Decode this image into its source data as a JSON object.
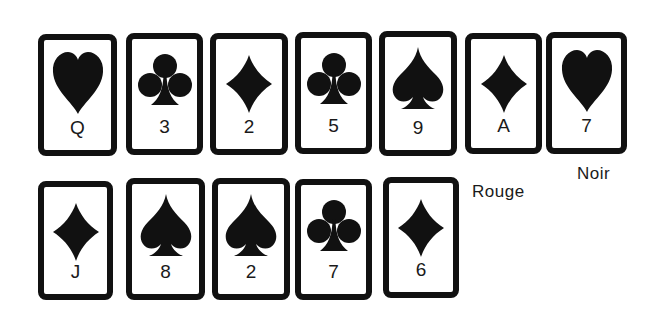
{
  "colors": {
    "ink": "#111111",
    "background": "#ffffff"
  },
  "rows": [
    {
      "cards": [
        {
          "suit": "heart",
          "icon": "heart-icon",
          "rank": "Q"
        },
        {
          "suit": "club",
          "icon": "club-icon",
          "rank": "3"
        },
        {
          "suit": "diamond",
          "icon": "diamond-icon",
          "rank": "2"
        },
        {
          "suit": "club",
          "icon": "club-icon",
          "rank": "5"
        },
        {
          "suit": "spade",
          "icon": "spade-icon",
          "rank": "9"
        },
        {
          "suit": "diamond",
          "icon": "diamond-icon",
          "rank": "A"
        },
        {
          "suit": "heart",
          "icon": "heart-icon",
          "rank": "7"
        }
      ]
    },
    {
      "cards": [
        {
          "suit": "diamond",
          "icon": "diamond-icon",
          "rank": "J"
        },
        {
          "suit": "spade",
          "icon": "spade-icon",
          "rank": "8"
        },
        {
          "suit": "spade",
          "icon": "spade-icon",
          "rank": "2"
        },
        {
          "suit": "club",
          "icon": "club-icon",
          "rank": "7"
        },
        {
          "suit": "diamond",
          "icon": "diamond-icon",
          "rank": "6"
        }
      ]
    }
  ],
  "labels": {
    "noir": "Noir",
    "rouge": "Rouge"
  }
}
